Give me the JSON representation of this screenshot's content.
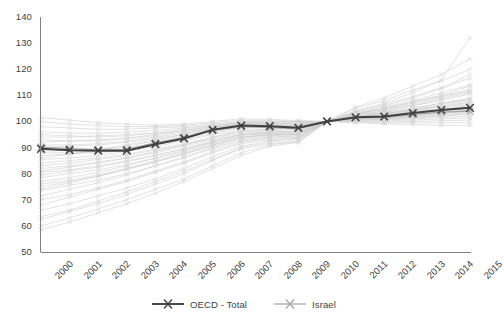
{
  "chart_data": {
    "type": "line",
    "title": "",
    "subtitle": "",
    "xlabel": "",
    "ylabel": "",
    "xlim": [
      2000,
      2015
    ],
    "ylim": [
      50,
      140
    ],
    "grid": false,
    "legend_position": "bottom",
    "x": [
      2000,
      2001,
      2002,
      2003,
      2004,
      2005,
      2006,
      2007,
      2008,
      2009,
      2010,
      2011,
      2012,
      2013,
      2014,
      2015
    ],
    "xtick_labels": [
      "2000",
      "2001",
      "2002",
      "2003",
      "2004",
      "2005",
      "2006",
      "2007",
      "2008",
      "2009",
      "2010",
      "2011",
      "2012",
      "2013",
      "2014",
      "2015"
    ],
    "ytick_labels": [
      "50",
      "60",
      "70",
      "80",
      "90",
      "100",
      "110",
      "120",
      "130",
      "140"
    ],
    "yticks": [
      50,
      60,
      70,
      80,
      90,
      100,
      110,
      120,
      130,
      140
    ],
    "series": [
      {
        "name": "OECD - Total",
        "color": "#404040",
        "emphasis": "primary",
        "marker": "x",
        "values": [
          89.5,
          89.0,
          88.8,
          88.8,
          91.3,
          93.5,
          96.8,
          98.4,
          98.2,
          97.6,
          100.0,
          101.6,
          101.9,
          103.2,
          104.4,
          105.2
        ]
      },
      {
        "name": "Israel",
        "color": "#a6a6a6",
        "emphasis": "secondary",
        "marker": "x",
        "values": [
          90.2,
          89.6,
          89.2,
          89.4,
          91.8,
          93.9,
          96.6,
          98.0,
          97.6,
          97.2,
          100.0,
          101.4,
          101.6,
          102.6,
          103.6,
          103.9
        ]
      }
    ],
    "background_series": [
      {
        "name": "country-01",
        "values": [
          60.0,
          63.0,
          66.5,
          70.0,
          74.0,
          78.0,
          83.0,
          88.0,
          91.0,
          92.5,
          100.0,
          104.0,
          107.0,
          111.0,
          116.0,
          132.0
        ]
      },
      {
        "name": "country-02",
        "values": [
          62.5,
          65.5,
          68.5,
          72.0,
          76.0,
          80.0,
          85.0,
          90.0,
          92.0,
          93.0,
          100.0,
          103.5,
          106.0,
          109.0,
          112.5,
          118.0
        ]
      },
      {
        "name": "country-03",
        "values": [
          66.0,
          68.5,
          71.5,
          74.5,
          78.0,
          82.0,
          86.5,
          90.5,
          92.5,
          93.5,
          100.0,
          103.0,
          105.0,
          107.5,
          110.0,
          113.5
        ]
      },
      {
        "name": "country-04",
        "values": [
          70.0,
          72.0,
          74.5,
          77.5,
          81.0,
          84.5,
          88.5,
          92.0,
          93.5,
          94.0,
          100.0,
          102.5,
          104.0,
          106.0,
          108.0,
          110.5
        ]
      },
      {
        "name": "country-05",
        "values": [
          73.5,
          75.5,
          77.5,
          80.0,
          83.0,
          86.0,
          89.5,
          92.5,
          94.0,
          94.5,
          100.0,
          102.0,
          103.5,
          105.0,
          107.0,
          109.0
        ]
      },
      {
        "name": "country-06",
        "values": [
          76.0,
          77.5,
          79.5,
          82.0,
          84.5,
          87.5,
          90.5,
          93.5,
          94.5,
          95.0,
          100.0,
          102.0,
          103.0,
          104.5,
          106.0,
          108.0
        ]
      },
      {
        "name": "country-07",
        "values": [
          78.5,
          80.0,
          81.5,
          83.5,
          86.0,
          88.5,
          91.5,
          94.0,
          95.0,
          95.5,
          100.0,
          101.8,
          102.8,
          104.0,
          105.5,
          107.0
        ]
      },
      {
        "name": "country-08",
        "values": [
          80.5,
          81.5,
          83.0,
          85.0,
          87.0,
          89.5,
          92.0,
          94.5,
          95.5,
          96.0,
          100.0,
          101.5,
          102.5,
          103.8,
          105.0,
          106.5
        ]
      },
      {
        "name": "country-09",
        "values": [
          82.0,
          83.0,
          84.5,
          86.0,
          88.0,
          90.5,
          93.0,
          95.0,
          96.0,
          96.5,
          100.0,
          101.5,
          102.3,
          103.5,
          104.5,
          106.0
        ]
      },
      {
        "name": "country-10",
        "values": [
          84.0,
          85.0,
          86.0,
          87.5,
          89.5,
          91.5,
          94.0,
          96.0,
          96.5,
          97.0,
          100.0,
          101.3,
          102.0,
          103.0,
          104.0,
          105.5
        ]
      },
      {
        "name": "country-11",
        "values": [
          85.5,
          86.0,
          87.0,
          88.5,
          90.5,
          92.5,
          95.0,
          96.5,
          97.0,
          97.5,
          100.0,
          101.2,
          101.8,
          102.8,
          103.8,
          105.0
        ]
      },
      {
        "name": "country-12",
        "values": [
          87.0,
          87.5,
          88.5,
          89.5,
          91.5,
          93.5,
          96.0,
          97.5,
          97.8,
          98.0,
          100.0,
          101.0,
          101.5,
          102.5,
          103.5,
          104.5
        ]
      },
      {
        "name": "country-13",
        "values": [
          88.5,
          89.0,
          89.5,
          90.5,
          92.5,
          94.5,
          96.5,
          98.0,
          98.3,
          98.5,
          100.0,
          101.0,
          101.3,
          102.0,
          103.0,
          104.0
        ]
      },
      {
        "name": "country-14",
        "values": [
          90.0,
          90.5,
          91.0,
          92.0,
          93.5,
          95.0,
          97.0,
          98.5,
          98.8,
          99.0,
          100.0,
          100.8,
          101.0,
          101.8,
          102.5,
          103.5
        ]
      },
      {
        "name": "country-15",
        "values": [
          92.0,
          92.5,
          93.0,
          93.5,
          94.5,
          96.0,
          97.5,
          99.0,
          99.2,
          99.3,
          100.0,
          100.6,
          100.8,
          101.3,
          102.0,
          102.8
        ]
      },
      {
        "name": "country-16",
        "values": [
          94.0,
          94.0,
          94.5,
          95.0,
          95.5,
          96.5,
          98.0,
          99.3,
          99.5,
          99.5,
          100.0,
          100.4,
          100.5,
          101.0,
          101.5,
          102.0
        ]
      },
      {
        "name": "country-17",
        "values": [
          96.0,
          95.5,
          95.5,
          96.0,
          96.5,
          97.5,
          98.5,
          99.5,
          99.8,
          99.8,
          100.0,
          100.2,
          100.2,
          100.5,
          101.0,
          101.3
        ]
      },
      {
        "name": "country-18",
        "values": [
          98.0,
          97.5,
          97.0,
          97.0,
          97.5,
          98.0,
          99.0,
          100.0,
          100.0,
          100.0,
          100.0,
          100.0,
          99.8,
          100.0,
          100.3,
          100.5
        ]
      },
      {
        "name": "country-19",
        "values": [
          100.0,
          99.0,
          98.5,
          98.0,
          98.0,
          98.5,
          99.5,
          100.5,
          100.3,
          100.0,
          100.0,
          99.8,
          99.5,
          99.5,
          99.5,
          99.5
        ]
      },
      {
        "name": "country-20",
        "values": [
          101.5,
          100.5,
          99.5,
          99.0,
          98.5,
          99.0,
          100.0,
          101.0,
          100.8,
          100.3,
          100.0,
          99.5,
          99.0,
          98.8,
          98.5,
          98.5
        ]
      },
      {
        "name": "country-21",
        "values": [
          86.0,
          87.5,
          89.0,
          91.0,
          93.0,
          95.0,
          97.5,
          99.5,
          99.0,
          98.0,
          100.0,
          102.0,
          103.0,
          104.5,
          106.5,
          108.5
        ]
      },
      {
        "name": "country-22",
        "values": [
          74.0,
          76.5,
          79.0,
          82.0,
          85.0,
          88.0,
          91.0,
          94.0,
          95.0,
          95.0,
          100.0,
          103.0,
          105.0,
          107.5,
          110.0,
          112.0
        ]
      },
      {
        "name": "country-23",
        "values": [
          68.0,
          71.0,
          74.0,
          77.0,
          80.5,
          84.0,
          88.0,
          91.5,
          93.0,
          93.5,
          100.0,
          104.0,
          106.5,
          109.5,
          113.0,
          116.5
        ]
      },
      {
        "name": "country-24",
        "values": [
          63.5,
          66.0,
          69.5,
          73.0,
          77.0,
          81.0,
          85.5,
          89.5,
          91.5,
          92.0,
          100.0,
          105.0,
          108.0,
          112.0,
          115.5,
          120.0
        ]
      },
      {
        "name": "country-25",
        "values": [
          81.0,
          82.5,
          84.0,
          86.0,
          88.5,
          91.0,
          94.0,
          96.5,
          96.5,
          96.0,
          100.0,
          102.5,
          104.0,
          106.0,
          108.5,
          111.0
        ]
      },
      {
        "name": "country-26",
        "values": [
          91.0,
          91.0,
          91.5,
          92.5,
          94.0,
          95.5,
          97.5,
          99.0,
          98.5,
          98.0,
          100.0,
          101.5,
          102.0,
          103.0,
          104.5,
          106.0
        ]
      },
      {
        "name": "country-27",
        "values": [
          77.0,
          78.5,
          80.5,
          83.0,
          86.0,
          89.0,
          92.0,
          95.0,
          95.5,
          95.0,
          100.0,
          102.8,
          104.5,
          106.5,
          109.0,
          111.5
        ]
      },
      {
        "name": "country-28",
        "values": [
          95.0,
          94.5,
          94.0,
          94.5,
          95.5,
          97.0,
          98.5,
          100.0,
          99.5,
          99.0,
          100.0,
          100.8,
          101.0,
          101.5,
          102.3,
          103.0
        ]
      },
      {
        "name": "country-29",
        "values": [
          71.5,
          74.0,
          76.5,
          79.5,
          83.0,
          86.5,
          90.0,
          93.0,
          94.0,
          94.0,
          100.0,
          103.2,
          105.5,
          108.0,
          111.0,
          114.0
        ]
      },
      {
        "name": "country-30",
        "values": [
          93.0,
          92.5,
          92.5,
          93.5,
          95.0,
          96.5,
          98.0,
          99.5,
          99.0,
          98.5,
          100.0,
          101.0,
          101.5,
          102.3,
          103.3,
          104.3
        ]
      },
      {
        "name": "country-31",
        "values": [
          58.5,
          61.5,
          65.0,
          68.5,
          72.5,
          77.0,
          82.0,
          87.0,
          90.5,
          92.0,
          100.0,
          105.5,
          109.0,
          113.5,
          118.0,
          124.0
        ]
      },
      {
        "name": "country-32",
        "values": [
          79.5,
          81.0,
          82.5,
          84.5,
          87.0,
          89.5,
          92.5,
          95.0,
          95.5,
          95.5,
          100.0,
          102.3,
          103.5,
          105.0,
          107.0,
          108.5
        ]
      },
      {
        "name": "country-33",
        "values": [
          88.0,
          88.0,
          88.0,
          89.0,
          91.0,
          93.0,
          95.5,
          97.5,
          97.5,
          97.5,
          100.0,
          101.5,
          102.0,
          103.0,
          104.0,
          105.0
        ]
      },
      {
        "name": "country-34",
        "values": [
          83.0,
          84.0,
          85.5,
          87.0,
          89.0,
          91.0,
          93.5,
          95.5,
          96.0,
          96.0,
          100.0,
          102.0,
          103.0,
          104.3,
          105.8,
          107.3
        ]
      },
      {
        "name": "country-35",
        "values": [
          75.0,
          77.0,
          79.0,
          81.5,
          84.5,
          87.5,
          91.0,
          94.0,
          94.8,
          94.8,
          100.0,
          103.0,
          104.8,
          107.0,
          109.5,
          112.0
        ]
      }
    ]
  },
  "legend": {
    "entries": [
      {
        "label": "OECD - Total",
        "color": "#404040"
      },
      {
        "label": "Israel",
        "color": "#a6a6a6"
      }
    ]
  },
  "axis": {
    "y_min_label": "50",
    "y_max_label": "140"
  }
}
